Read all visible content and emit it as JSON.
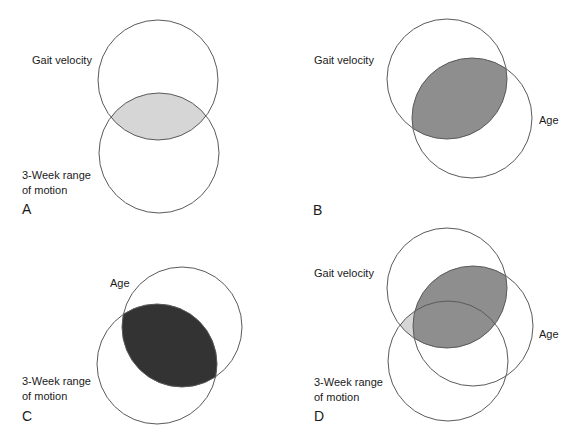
{
  "figure": {
    "panels": [
      {
        "id": "A",
        "label": "A",
        "circles": [
          {
            "name": "Gait velocity",
            "cx": 158,
            "cy": 80,
            "r": 60
          },
          {
            "name": "3-Week range of motion",
            "cx": 159,
            "cy": 153,
            "r": 60
          }
        ],
        "labels": {
          "gait": "Gait velocity",
          "rom_line1": "3-Week range",
          "rom_line2": "of motion"
        },
        "shaded_overlap": "Gait velocity ∩ 3-Week range of motion",
        "fill_color": "#d6d6d6"
      },
      {
        "id": "B",
        "label": "B",
        "circles": [
          {
            "name": "Gait velocity",
            "cx": 447,
            "cy": 79,
            "r": 60
          },
          {
            "name": "Age",
            "cx": 472,
            "cy": 118,
            "r": 60
          }
        ],
        "labels": {
          "gait": "Gait velocity",
          "age": "Age"
        },
        "shaded_overlap": "Gait velocity ∩ Age",
        "fill_color": "#8e8e8e"
      },
      {
        "id": "C",
        "label": "C",
        "circles": [
          {
            "name": "Age",
            "cx": 182,
            "cy": 327,
            "r": 60
          },
          {
            "name": "3-Week range of motion",
            "cx": 157,
            "cy": 364,
            "r": 60
          }
        ],
        "labels": {
          "age": "Age",
          "rom_line1": "3-Week range",
          "rom_line2": "of motion"
        },
        "shaded_overlap": "Age ∩ 3-Week range of motion",
        "fill_color": "#333333"
      },
      {
        "id": "D",
        "label": "D",
        "circles": [
          {
            "name": "Gait velocity",
            "cx": 447,
            "cy": 288,
            "r": 60
          },
          {
            "name": "Age",
            "cx": 473,
            "cy": 326,
            "r": 60
          },
          {
            "name": "3-Week range of motion",
            "cx": 448,
            "cy": 361,
            "r": 60
          }
        ],
        "labels": {
          "gait": "Gait velocity",
          "age": "Age",
          "rom_line1": "3-Week range",
          "rom_line2": "of motion"
        },
        "shaded_overlaps": [
          {
            "region": "Gait velocity ∩ Age",
            "fill_color": "#8e8e8e"
          },
          {
            "region": "Gait velocity ∩ 3-Week range of motion (outside Age)",
            "fill_color": "#d6d6d6"
          }
        ]
      }
    ],
    "stroke_color": "#5a5a5a",
    "caption": ""
  }
}
